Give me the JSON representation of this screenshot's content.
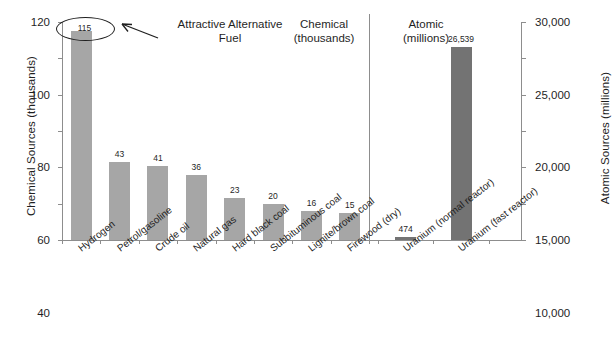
{
  "chart_data": {
    "type": "bar",
    "title": "",
    "subtitle": "",
    "sections": [
      {
        "name": "chemical",
        "header_line1": "Chemical",
        "header_line2": "(thousands)",
        "axis": "left",
        "categories": [
          "Hydrogen",
          "Petrol/gasoline",
          "Crude oil",
          "Natural gas",
          "Hard black coal",
          "Subbituminous coal",
          "Lignite/brown coal",
          "Firewood (dry)"
        ],
        "values": [
          115,
          43,
          41,
          36,
          23,
          20,
          16,
          15
        ],
        "value_labels": [
          "115",
          "43",
          "41",
          "36",
          "23",
          "20",
          "16",
          "15"
        ],
        "color": "#a6a6a6"
      },
      {
        "name": "atomic",
        "header_line1": "Atomic",
        "header_line2": "(millions)",
        "axis": "right",
        "categories": [
          "Uranium (normal reactor)",
          "Uranium (fast reactor)"
        ],
        "values": [
          474,
          26539
        ],
        "value_labels": [
          "474",
          "26,539"
        ],
        "color": "#737373"
      }
    ],
    "ylabel": "Chemical Sources (thousands)",
    "ylabel_right": "Atomic Sources (millions)",
    "xlabel": "",
    "ylim": [
      0,
      120
    ],
    "ylim_right": [
      0,
      30000
    ],
    "yticks": [
      0,
      20,
      40,
      60,
      80,
      100,
      120
    ],
    "ytick_labels": [
      "0",
      "20",
      "40",
      "60",
      "80",
      "100",
      "120"
    ],
    "yticks_right": [
      0,
      5000,
      10000,
      15000,
      20000,
      25000,
      30000
    ],
    "ytick_labels_right": [
      "0",
      "5,000",
      "10,000",
      "15,000",
      "20,000",
      "25,000",
      "30,000"
    ],
    "grid": false,
    "legend": "none",
    "annotations": [
      {
        "name": "attractive-alternative-fuel",
        "circled_value": "115",
        "text_line1": "Attractive Alternative",
        "text_line2": "Fuel",
        "points_to": "Hydrogen"
      }
    ],
    "colors": {
      "chemical_bar": "#a6a6a6",
      "atomic_bar": "#737373",
      "axis": "#8d8d8d",
      "text": "#1f1f1f",
      "background": "#ffffff"
    }
  }
}
